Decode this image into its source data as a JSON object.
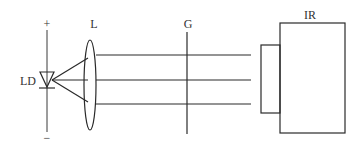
{
  "diagram": {
    "title": "",
    "labels": {
      "plus": "+",
      "minus": "−",
      "laser_diode": "LD",
      "lens": "L",
      "grating": "G",
      "receiver": "IR"
    },
    "components": [
      {
        "id": "laser_diode",
        "label": "LD",
        "type": "diode-symbol"
      },
      {
        "id": "lens",
        "label": "L",
        "type": "convex-lens"
      },
      {
        "id": "grating",
        "label": "G",
        "type": "vertical-line"
      },
      {
        "id": "receiver",
        "label": "IR",
        "type": "box-with-aperture"
      }
    ],
    "beams": {
      "count": 3,
      "description": "Diverging rays from LD collimated by lens L into three parallel beams passing through G into IR"
    },
    "colors": {
      "stroke": "#2a2a2a",
      "text": "#333333",
      "background": "#ffffff"
    }
  }
}
